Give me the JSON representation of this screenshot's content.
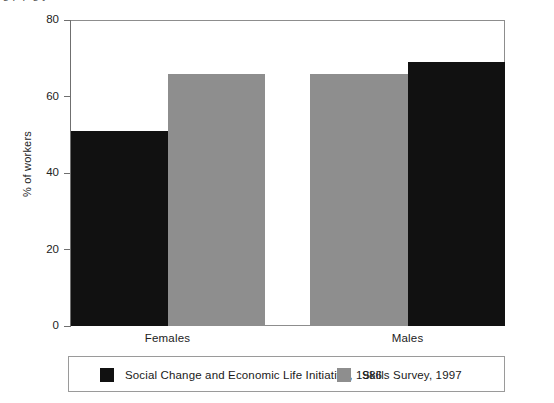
{
  "figure": {
    "title_cut_off": "ig       p            p    g   y",
    "y_axis_label": "% of workers"
  },
  "axis": {
    "y_ticks": [
      "0",
      "20",
      "40",
      "60",
      "80"
    ],
    "x_categories": [
      "Females",
      "Males"
    ]
  },
  "legend": {
    "entries": [
      {
        "label": "Social Change and Economic Life Initiative, 1986",
        "color": "#111111",
        "swatch": "dark"
      },
      {
        "label": "Skills Survey, 1997",
        "color": "#8e8e8e",
        "swatch": "light"
      }
    ]
  },
  "colors": {
    "series_dark": "#111111",
    "series_light": "#8e8e8e",
    "frame": "#8d8d8d",
    "background": "#ffffff"
  },
  "chart_data": {
    "type": "bar",
    "title": "",
    "xlabel": "",
    "ylabel": "% of workers",
    "categories": [
      "Females",
      "Males"
    ],
    "series": [
      {
        "name": "Social Change and Economic Life Initiative, 1986",
        "color": "#111111",
        "values": [
          51,
          69
        ]
      },
      {
        "name": "Skills Survey, 1997",
        "color": "#8e8e8e",
        "values": [
          66,
          66
        ]
      }
    ],
    "ylim": [
      0,
      80
    ],
    "ytick_step": 20,
    "grid": false,
    "legend_position": "bottom",
    "bar_gap_within_group": 0,
    "note": "Bars are drawn adjacent within each group; Females group order is dark then light, Males group order is light then dark."
  }
}
